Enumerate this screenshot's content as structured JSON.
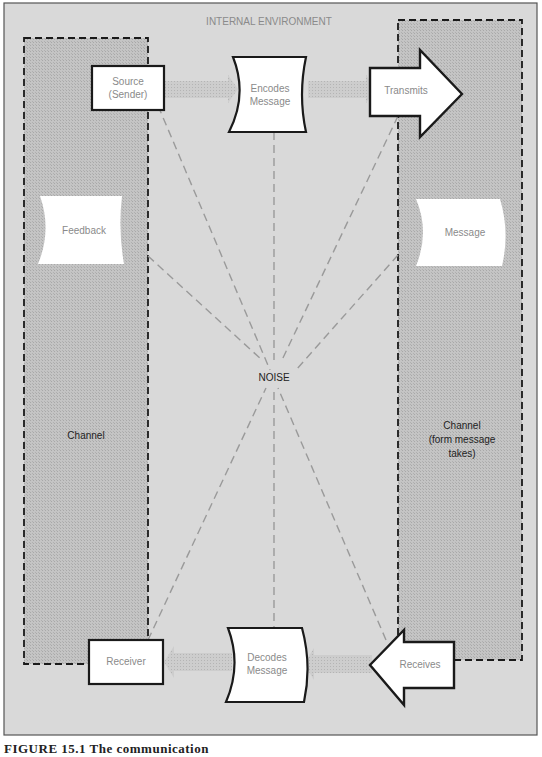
{
  "figure": {
    "frame_title": "INTERNAL ENVIRONMENT",
    "center_label": "NOISE",
    "caption": "FIGURE 15.1  The communication",
    "colors": {
      "background": "#d9d9d9",
      "channel_fill": "#bdbdbd",
      "box_fill": "#ffffff",
      "outline": "#1a1a1a",
      "noise_lines": "#9a9a9a",
      "label_text": "#8a8a8a"
    }
  },
  "nodes": {
    "source": {
      "line1": "Source",
      "line2": "(Sender)"
    },
    "encodes": {
      "line1": "Encodes",
      "line2": "Message"
    },
    "transmits": {
      "label": "Transmits"
    },
    "message": {
      "label": "Message"
    },
    "feedback": {
      "label": "Feedback"
    },
    "receiver": {
      "label": "Receiver"
    },
    "decodes": {
      "line1": "Decodes",
      "line2": "Message"
    },
    "receives": {
      "label": "Receives"
    }
  },
  "channels": {
    "left": {
      "label": "Channel"
    },
    "right": {
      "line1": "Channel",
      "line2": "(form message",
      "line3": "takes)"
    }
  }
}
